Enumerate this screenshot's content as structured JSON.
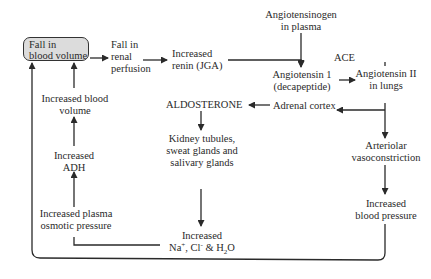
{
  "diagram": {
    "type": "flowchart",
    "nodes": {
      "start": {
        "line1": "Fall in",
        "line2": "blood volume"
      },
      "renal": {
        "line1": "Fall in",
        "line2": "renal",
        "line3": "perfusion"
      },
      "renin": {
        "line1": "Increased",
        "line2": "renin (JGA)"
      },
      "angiotensinogen": {
        "line1": "Angiotensinogen",
        "line2": "in plasma"
      },
      "ace": {
        "label": "ACE"
      },
      "ang1": {
        "line1": "Angiotensin 1",
        "line2": "(decapeptide)"
      },
      "ang2": {
        "line1": "Angiotensin II",
        "line2": "in lungs"
      },
      "adrenal": {
        "label": "Adrenal cortex"
      },
      "aldosterone": {
        "label": "ALDOSTERONE"
      },
      "kidney": {
        "line1": "Kidney tubules,",
        "line2": "sweat glands and",
        "line3": "salivary glands"
      },
      "arteriolar": {
        "line1": "Arteriolar",
        "line2": "vasoconstriction"
      },
      "bp": {
        "line1": "Increased",
        "line2": "blood pressure"
      },
      "ions": {
        "line1": "Increased",
        "na": "Na",
        "na_sup": "+",
        "cl": ", Cl",
        "cl_sup": "-",
        "and_h": " & H",
        "h_sub": "2",
        "o": "O"
      },
      "osmotic": {
        "line1": "Increased plasma",
        "line2": "osmotic pressure"
      },
      "adh": {
        "line1": "Increased",
        "line2": "ADH"
      },
      "blood_volume": {
        "line1": "Increased blood",
        "line2": "volume"
      }
    },
    "colors": {
      "start_fill": "#dcdcdc",
      "line": "#2a2a2a",
      "background": "#ffffff"
    }
  }
}
